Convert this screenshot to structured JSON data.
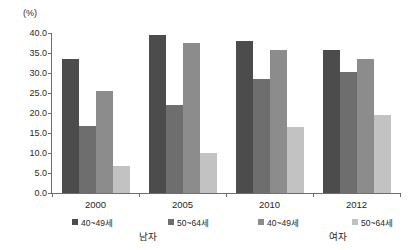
{
  "chart_data": {
    "type": "bar",
    "title": "",
    "subtitle": "",
    "xlabel": "",
    "ylabel": "(%)",
    "ylim": [
      0.0,
      40.0
    ],
    "ytick_step": 5.0,
    "grid": false,
    "legend_position": "bottom",
    "categories": [
      "2000",
      "2005",
      "2010",
      "2012"
    ],
    "ytick_labels": [
      "0.0",
      "5.0",
      "10.0",
      "15.0",
      "20.0",
      "25.0",
      "30.0",
      "35.0",
      "40.0"
    ],
    "ytick_values": [
      0.0,
      5.0,
      10.0,
      15.0,
      20.0,
      25.0,
      30.0,
      35.0,
      40.0
    ],
    "series": [
      {
        "name": "40~49세",
        "group": "남자",
        "color": "#4c4c4c",
        "values": [
          33.5,
          39.5,
          38.0,
          35.8
        ]
      },
      {
        "name": "50~64세",
        "group": "남자",
        "color": "#6e6e6e",
        "values": [
          16.8,
          22.0,
          28.5,
          30.2
        ]
      },
      {
        "name": "40~49세",
        "group": "여자",
        "color": "#8c8c8c",
        "values": [
          25.5,
          37.5,
          35.8,
          33.6
        ]
      },
      {
        "name": "50~64세",
        "group": "여자",
        "color": "#c2c2c2",
        "values": [
          6.8,
          10.0,
          16.5,
          19.5
        ]
      }
    ],
    "legend": [
      {
        "label": "40~49세",
        "color": "#4c4c4c"
      },
      {
        "label": "50~64세",
        "color": "#6e6e6e"
      },
      {
        "label": "40~49세",
        "color": "#8c8c8c"
      },
      {
        "label": "50~64세",
        "color": "#c2c2c2"
      }
    ],
    "legend_group_labels": [
      "남자",
      "여자"
    ]
  }
}
